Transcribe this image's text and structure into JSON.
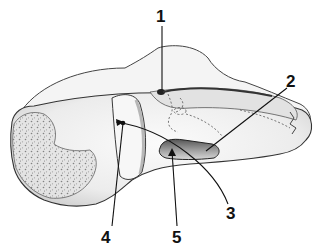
{
  "figure": {
    "background": "#ffffff",
    "ink": "#1a1a1a",
    "labels": [
      {
        "text": "1",
        "x": 158,
        "y": 8
      },
      {
        "text": "2",
        "x": 287,
        "y": 74
      },
      {
        "text": "3",
        "x": 226,
        "y": 205
      },
      {
        "text": "4",
        "x": 101,
        "y": 229
      },
      {
        "text": "5",
        "x": 172,
        "y": 229
      }
    ]
  }
}
